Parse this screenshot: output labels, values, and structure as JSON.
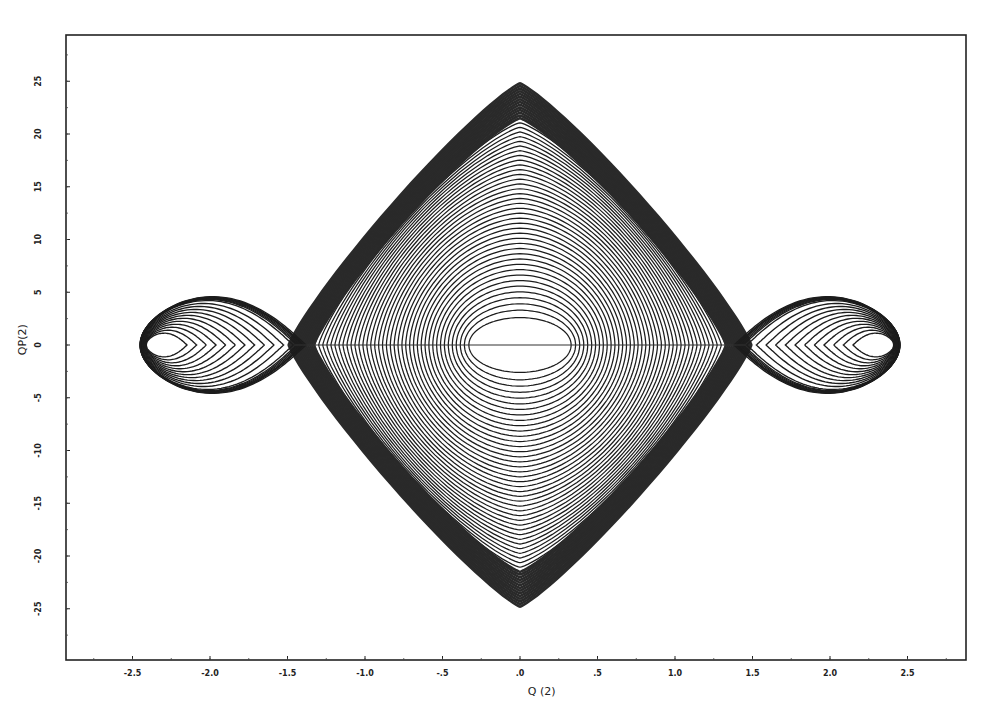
{
  "chart_data": {
    "type": "line",
    "subtype": "phase-portrait",
    "title": "",
    "xlabel": "Q (2)",
    "ylabel": "QP(2)",
    "xlim": [
      -2.95,
      2.85
    ],
    "ylim": [
      -29.5,
      29.5
    ],
    "x_ticks": [
      -2.5,
      -2.0,
      -1.5,
      -1.0,
      -0.5,
      0.0,
      0.5,
      1.0,
      1.5,
      2.0,
      2.5
    ],
    "x_tick_labels": [
      "-2.5",
      "-2.0",
      "-1.5",
      "-1.0",
      "-.5",
      ".0",
      ".5",
      "1.0",
      "1.5",
      "2.0",
      "2.5"
    ],
    "y_ticks": [
      25,
      20,
      15,
      10,
      5,
      0,
      -5,
      -10,
      -15,
      -20,
      -25
    ],
    "y_tick_labels": [
      "25",
      "20",
      "15",
      "10",
      "5",
      "0",
      "-5",
      "-10",
      "-15",
      "-20",
      "-25"
    ],
    "grid": false,
    "legend": null,
    "series": [
      {
        "name": "central closed orbits",
        "description": "nested closed trajectories centered at origin; innermost ellipse approx Q in [-0.33, 0.33], QP in [-2.6, 2.6]; outermost approx Q in [-1.25, 1.25], QP in [-22, 22]",
        "center": [
          0.0,
          0.0
        ],
        "count": 40,
        "inner_q_amp": 0.33,
        "inner_qp_amp": 2.6,
        "outer_q_amp": 1.25,
        "outer_qp_amp": 21.5
      },
      {
        "name": "separatrix band",
        "description": "dense dark band of trajectories around central region; outer extent approx Q in [-1.37, 1.37], QP in [-25, 25]",
        "inner_q_amp": 1.25,
        "inner_qp_amp": 21.5,
        "outer_q_amp": 1.4,
        "outer_qp_amp": 24.8
      },
      {
        "name": "left lobe orbits",
        "description": "teardrop orbits with cusp near Q=-1.4, extending left to Q approx -2.45, QP within [-6.3, 6.3]",
        "cusp_q": -1.4,
        "tip_q": -2.45,
        "qp_amp": 6.3,
        "count": 13
      },
      {
        "name": "right lobe orbits",
        "description": "teardrop orbits with cusp near Q=1.4, extending right to Q approx 2.45, QP within [-6.3, 6.3]",
        "cusp_q": 1.4,
        "tip_q": 2.45,
        "qp_amp": 6.3,
        "count": 13
      }
    ]
  },
  "layout": {
    "frame": {
      "left": 66,
      "top": 35,
      "right": 966,
      "bottom": 660
    },
    "x_zero_px": 520,
    "x_px_per_unit": 155,
    "y_zero_px": 345,
    "y_px_per_unit": 10.55
  },
  "colors": {
    "ink": "#1c1c1c",
    "band": "#2a2a2a",
    "background": "#ffffff"
  }
}
